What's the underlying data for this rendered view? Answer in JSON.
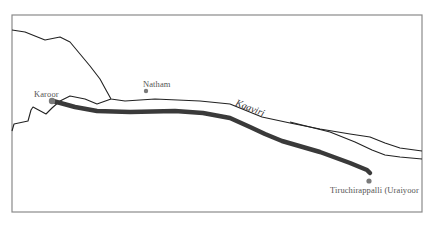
{
  "map": {
    "frame": {
      "x": 12,
      "y": 15,
      "width": 410,
      "height": 197,
      "stroke": "#8a8a8a"
    },
    "colors": {
      "outline": "#222222",
      "route": "#3a3a3a",
      "marker": "#7a7a7a",
      "label": "#555555"
    },
    "river": {
      "name": "Kaaviri"
    },
    "places": [
      {
        "name": "Karoor",
        "marker": {
          "x": 52,
          "y": 101
        },
        "label": {
          "x": 34,
          "y": 89
        }
      },
      {
        "name": "Natham",
        "marker": {
          "x": 146,
          "y": 91
        },
        "label": {
          "x": 143,
          "y": 79
        }
      },
      {
        "name": "Tiruchirappalli (Uraiyoor",
        "marker": {
          "x": 369,
          "y": 181
        },
        "label": {
          "x": 330,
          "y": 185
        }
      }
    ],
    "paths": {
      "upper_bank": "M12,30 L25,32 L45,40 L60,37 L70,42 L80,54 L90,66 L100,79 L106,90 L111,99 L125,101 L155,99 L200,101 L230,104",
      "lower_bank": "M12,131 L14,124 L28,121 L31,110 L33,107 L46,114 L52,108 L60,101 L70,96 L85,99 L97,104 L111,99",
      "river_upper": "M230,104 L262,117 L290,123 L320,129 L350,134 L370,137 L385,143 L400,148 L422,151",
      "river_lower": "M290,122 L330,132 L355,142 L372,150 L385,155 L400,157 L422,159",
      "route": "M53,101 L75,107 L97,111 L130,112 L175,111 L203,113 L230,118 L250,127 L265,134 L282,141 L320,152 L350,163 L367,170 L370,173"
    }
  }
}
